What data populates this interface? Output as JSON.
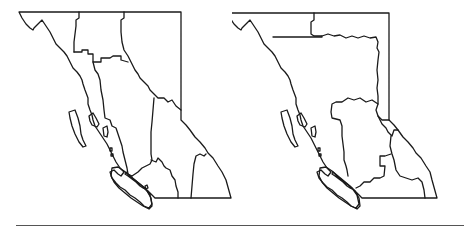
{
  "figure": {
    "maps": [
      {
        "id": "left",
        "subject": "British Columbia regions outline (variant A)",
        "stroke": "#1a1a1a"
      },
      {
        "id": "right",
        "subject": "British Columbia regions outline (variant B)",
        "stroke": "#1a1a1a"
      }
    ],
    "divider_color": "#555555",
    "background": "#ffffff"
  }
}
